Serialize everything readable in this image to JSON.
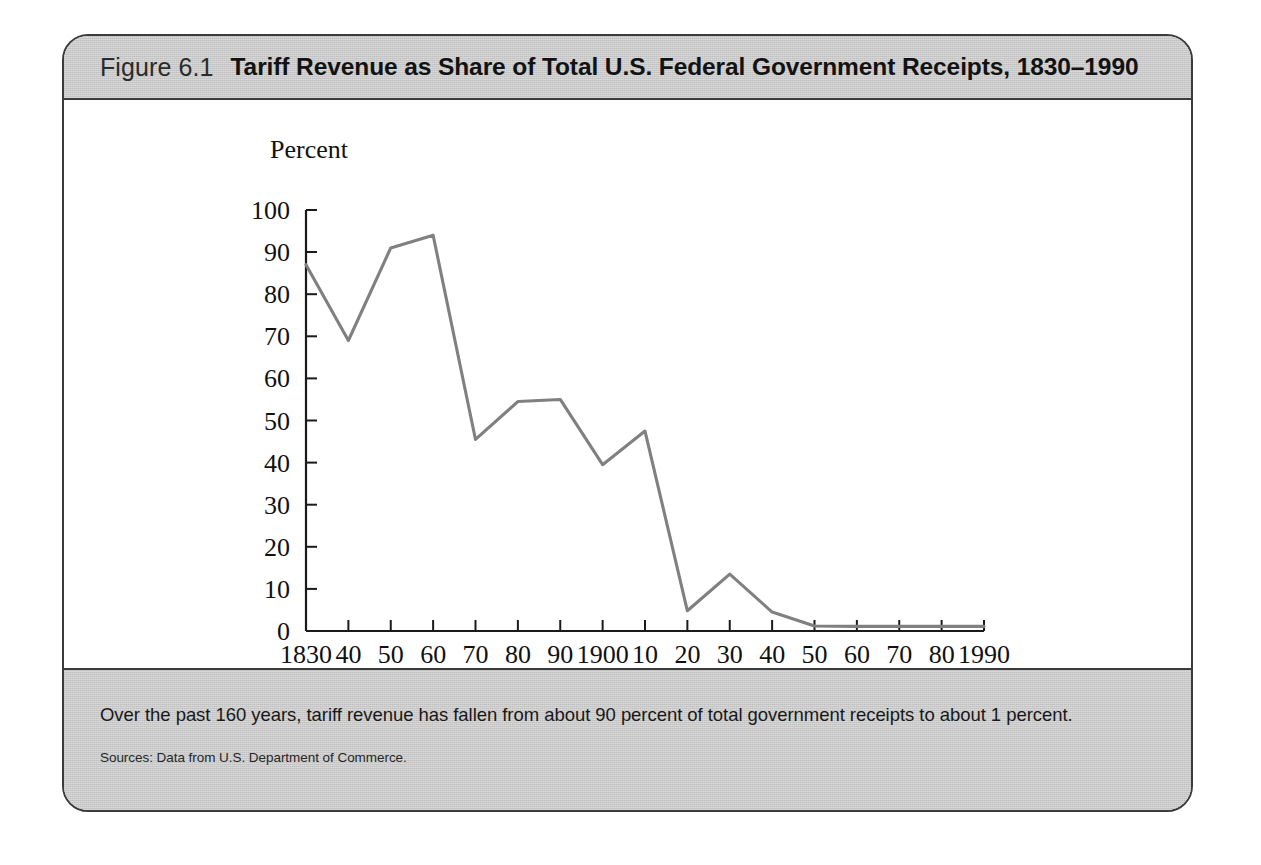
{
  "figure": {
    "number_label": "Figure 6.1",
    "title": "Tariff Revenue as Share of Total U.S. Federal Government Receipts, 1830–1990",
    "caption": "Over the past 160 years, tariff revenue has fallen from about 90 percent of total government receipts to about 1 percent.",
    "source": "Sources: Data from U.S. Department of Commerce."
  },
  "colors": {
    "band_background": "#c9c9c9",
    "frame_border": "#3b3b3b",
    "plot_background": "#ffffff",
    "line": "#808080",
    "axis": "#1a1a1a",
    "text": "#111111"
  },
  "chart_data": {
    "type": "line",
    "title": "Tariff Revenue as Share of Total U.S. Federal Government Receipts, 1830–1990",
    "xlabel": "Year",
    "ylabel": "Percent",
    "ylabel_position": "top-left",
    "xlabel_position": "bottom-right",
    "grid": false,
    "legend": "none",
    "xlim": [
      1830,
      1990
    ],
    "ylim": [
      0,
      100
    ],
    "ytick_step": 10,
    "xtick_step": 10,
    "yticks": [
      0,
      10,
      20,
      30,
      40,
      50,
      60,
      70,
      80,
      90,
      100
    ],
    "ytick_labels": [
      "0",
      "10",
      "20",
      "30",
      "40",
      "50",
      "60",
      "70",
      "80",
      "90",
      "100"
    ],
    "xticks": [
      1830,
      1840,
      1850,
      1860,
      1870,
      1880,
      1890,
      1900,
      1910,
      1920,
      1930,
      1940,
      1950,
      1960,
      1970,
      1980,
      1990
    ],
    "xtick_labels": [
      "1830",
      "40",
      "50",
      "60",
      "70",
      "80",
      "90",
      "1900",
      "10",
      "20",
      "30",
      "40",
      "50",
      "60",
      "70",
      "80",
      "1990"
    ],
    "x": [
      1830,
      1840,
      1850,
      1860,
      1870,
      1880,
      1890,
      1900,
      1910,
      1920,
      1930,
      1940,
      1950,
      1960,
      1970,
      1980,
      1990
    ],
    "values": [
      87,
      69,
      91,
      94,
      45.5,
      54.5,
      55,
      39.5,
      47.5,
      4.8,
      13.5,
      4.5,
      1.2,
      1.1,
      1.1,
      1.1,
      1.1
    ],
    "series": [
      {
        "name": "Tariff revenue share of total federal receipts",
        "values": [
          87,
          69,
          91,
          94,
          45.5,
          54.5,
          55,
          39.5,
          47.5,
          4.8,
          13.5,
          4.5,
          1.2,
          1.1,
          1.1,
          1.1,
          1.1
        ]
      }
    ]
  }
}
